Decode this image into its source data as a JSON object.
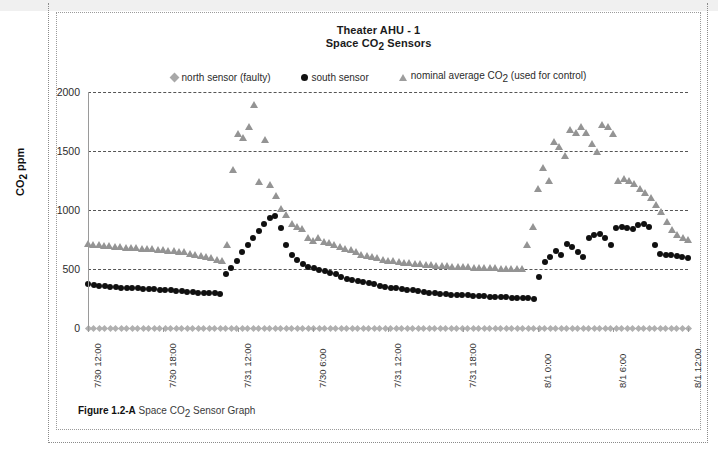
{
  "figure": {
    "caption_label": "Figure 1.2-A",
    "caption_text": "Space CO2 Sensor Graph"
  },
  "chart_data": {
    "type": "scatter",
    "title": "Theater AHU - 1",
    "subtitle": "Space CO2 Sensors",
    "title_line1": "Theater AHU - 1",
    "title_line2_pre": "Space CO",
    "title_line2_sub": "2",
    "title_line2_post": " Sensors",
    "xlabel": "",
    "ylabel": "CO2 ppm",
    "ylabel_pre": "CO",
    "ylabel_sub": "2",
    "ylabel_post": " ppm",
    "ylim": [
      0,
      2000
    ],
    "yticks": [
      0,
      500,
      1000,
      1500,
      2000
    ],
    "ytick_labels": [
      "0",
      "500",
      "1000",
      "1500",
      "2000"
    ],
    "grid": true,
    "grid_style": "dashed horizontal",
    "legend_position": "top-center",
    "xtick_labels": [
      "7/30 12:00",
      "7/30 18:00",
      "7/31 12:00",
      "7/30 6:00",
      "7/31 12:00",
      "7/31 18:00",
      "8/1 0:00",
      "8/1 6:00",
      "8/1 12:00"
    ],
    "xtick_positions": [
      0,
      0.125,
      0.25,
      0.375,
      0.5,
      0.625,
      0.75,
      0.875,
      1.0
    ],
    "n_points": 110,
    "series": [
      {
        "name": "north sensor (faulty)",
        "marker": "diamond",
        "color": "#b0b0b0",
        "values": [
          0,
          0,
          0,
          0,
          0,
          0,
          0,
          0,
          0,
          0,
          0,
          0,
          0,
          0,
          0,
          0,
          0,
          0,
          0,
          0,
          0,
          0,
          0,
          0,
          0,
          0,
          0,
          0,
          0,
          0,
          0,
          0,
          0,
          0,
          0,
          0,
          0,
          0,
          0,
          0,
          0,
          0,
          0,
          0,
          0,
          0,
          0,
          0,
          0,
          0,
          0,
          0,
          0,
          0,
          0,
          0,
          0,
          0,
          0,
          0,
          0,
          0,
          0,
          0,
          0,
          0,
          0,
          0,
          0,
          0,
          0,
          0,
          0,
          0,
          0,
          0,
          0,
          0,
          0,
          0,
          0,
          0,
          0,
          0,
          0,
          0,
          0,
          0,
          0,
          0,
          0,
          0,
          0,
          0,
          0,
          0,
          0,
          0,
          0,
          0,
          0,
          0,
          0,
          0,
          0,
          0,
          0,
          0,
          0,
          0
        ]
      },
      {
        "name": "south sensor",
        "marker": "circle",
        "color": "#101010",
        "values": [
          370,
          362,
          358,
          352,
          350,
          345,
          342,
          340,
          338,
          335,
          332,
          330,
          328,
          325,
          322,
          318,
          315,
          312,
          308,
          305,
          300,
          298,
          296,
          294,
          292,
          460,
          510,
          570,
          640,
          700,
          760,
          820,
          880,
          930,
          950,
          845,
          700,
          620,
          575,
          540,
          520,
          505,
          495,
          485,
          470,
          455,
          430,
          418,
          405,
          398,
          392,
          385,
          372,
          360,
          350,
          342,
          335,
          330,
          322,
          318,
          312,
          305,
          300,
          295,
          290,
          285,
          282,
          280,
          278,
          276,
          272,
          270,
          268,
          266,
          264,
          262,
          260,
          258,
          256,
          254,
          252,
          250,
          430,
          560,
          600,
          650,
          620,
          710,
          690,
          640,
          600,
          760,
          790,
          800,
          760,
          700,
          850,
          860,
          850,
          840,
          870,
          880,
          860,
          700,
          630,
          620,
          615,
          610,
          600,
          590
        ]
      },
      {
        "name": "nominal average CO2 (used for control)",
        "marker": "triangle",
        "color": "#949494",
        "values": [
          710,
          705,
          700,
          698,
          695,
          690,
          685,
          682,
          680,
          678,
          672,
          670,
          668,
          665,
          660,
          655,
          650,
          645,
          640,
          630,
          620,
          612,
          600,
          590,
          580,
          570,
          700,
          1340,
          1640,
          1610,
          1700,
          1890,
          1240,
          1590,
          1210,
          1120,
          1010,
          960,
          880,
          860,
          840,
          760,
          740,
          760,
          730,
          720,
          700,
          690,
          670,
          660,
          640,
          620,
          610,
          600,
          590,
          580,
          570,
          565,
          560,
          555,
          550,
          545,
          540,
          535,
          530,
          528,
          525,
          522,
          520,
          518,
          516,
          514,
          512,
          510,
          508,
          506,
          505,
          504,
          503,
          502,
          501,
          500,
          700,
          860,
          1180,
          1360,
          1250,
          1580,
          1530,
          1460,
          1680,
          1650,
          1700,
          1650,
          1560,
          1490,
          1720,
          1700,
          1640,
          1250,
          1260,
          1250,
          1220,
          1180,
          1140,
          1100,
          1040,
          980,
          900,
          830,
          790,
          760,
          750
        ]
      }
    ]
  }
}
